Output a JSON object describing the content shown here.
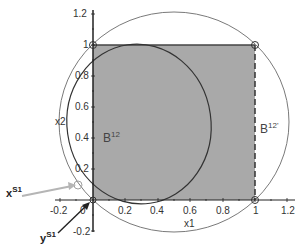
{
  "axes": {
    "x_label": "x1",
    "y_label": "x2",
    "x_ticks": [
      "-0.2",
      "0",
      "0.2",
      "0.4",
      "0.6",
      "0.8",
      "1",
      "1.2"
    ],
    "y_ticks": [
      "-0.2",
      "0.2",
      "0.4",
      "0.6",
      "0.8",
      "1",
      "1.2"
    ],
    "xlim": [
      -0.25,
      1.25
    ],
    "ylim": [
      -0.25,
      1.25
    ]
  },
  "regions": {
    "ellipse_label": "B",
    "ellipse_sup": "12",
    "square_edge_label": "B",
    "square_edge_sup": "12'"
  },
  "pointers": {
    "x_label": "x",
    "x_sup": "S1",
    "y_label": "y",
    "y_sup": "S1"
  },
  "colors": {
    "square_fill": "#a9a9a9",
    "outline": "#222222",
    "circle": "#7a7a7a",
    "x_arrow": "#b5b5b5",
    "y_arrow": "#222222"
  }
}
